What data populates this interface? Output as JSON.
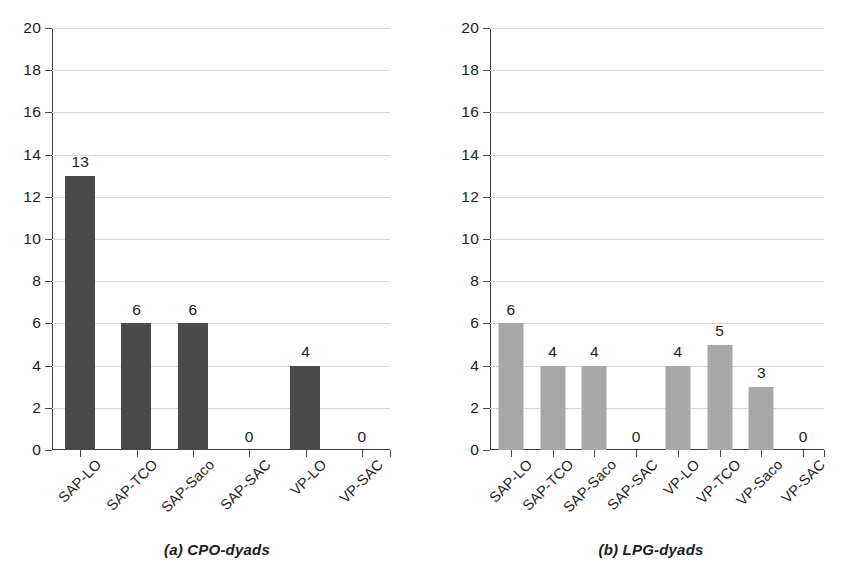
{
  "chart_data": [
    {
      "type": "bar",
      "title": "",
      "caption": "(a) CPO-dyads",
      "panel_label": "a",
      "categories": [
        "SAP-LO",
        "SAP-TCO",
        "SAP-Saco",
        "SAP-SAC",
        "VP-LO",
        "VP-SAC"
      ],
      "values": [
        13,
        6,
        6,
        0,
        4,
        0
      ],
      "value_labels": [
        "13",
        "6",
        "6",
        "0",
        "4",
        "0"
      ],
      "xlabel": "",
      "ylabel": "",
      "ylim": [
        0,
        20
      ],
      "yticks": [
        0,
        2,
        4,
        6,
        8,
        10,
        12,
        14,
        16,
        18,
        20
      ],
      "ytick_labels": [
        "0",
        "2",
        "4",
        "6",
        "8",
        "10",
        "12",
        "14",
        "16",
        "18",
        "20"
      ],
      "grid": true,
      "legend": "none",
      "bar_color": "#4a4a4a"
    },
    {
      "type": "bar",
      "title": "",
      "caption": "(b) LPG-dyads",
      "panel_label": "b",
      "categories": [
        "SAP-LO",
        "SAP-TCO",
        "SAP-Saco",
        "SAP-SAC",
        "VP-LO",
        "VP-TCO",
        "VP-Saco",
        "VP-SAC"
      ],
      "values": [
        6,
        4,
        4,
        0,
        4,
        5,
        3,
        0
      ],
      "value_labels": [
        "6",
        "4",
        "4",
        "0",
        "4",
        "5",
        "3",
        "0"
      ],
      "xlabel": "",
      "ylabel": "",
      "ylim": [
        0,
        20
      ],
      "yticks": [
        0,
        2,
        4,
        6,
        8,
        10,
        12,
        14,
        16,
        18,
        20
      ],
      "ytick_labels": [
        "0",
        "2",
        "4",
        "6",
        "8",
        "10",
        "12",
        "14",
        "16",
        "18",
        "20"
      ],
      "grid": true,
      "legend": "none",
      "bar_color": "#a8a8a8"
    }
  ]
}
